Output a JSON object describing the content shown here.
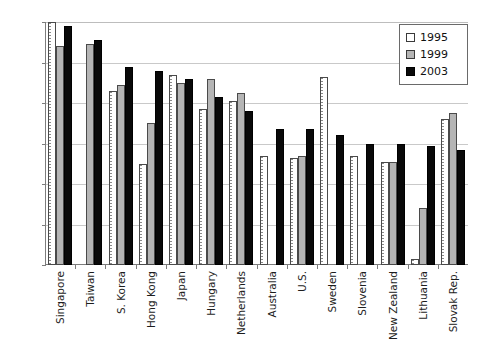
{
  "chart_data": {
    "type": "bar",
    "title": "",
    "subtitle": "",
    "xlabel": "",
    "ylabel": "",
    "ylim": [
      460,
      580
    ],
    "yticks": [
      460,
      480,
      500,
      520,
      540,
      560,
      580
    ],
    "grid": true,
    "legend_position": "top-right",
    "categories": [
      "Singapore",
      "Taiwan",
      "S. Korea",
      "Hong Kong",
      "Japan",
      "Hungary",
      "Netherlands",
      "Australia",
      "U.S.",
      "Sweden",
      "Slovenia",
      "New Zealand",
      "Lithuania",
      "Slovak Rep."
    ],
    "series": [
      {
        "name": "1995",
        "color": "#ffffff",
        "values": [
          580,
          null,
          546,
          510,
          554,
          537,
          541,
          514,
          513,
          553,
          514,
          511,
          463,
          532
        ]
      },
      {
        "name": "1999",
        "color": "#b5b5b5",
        "values": [
          568,
          569,
          549,
          530,
          550,
          552,
          545,
          null,
          514,
          null,
          null,
          511,
          488,
          535
        ]
      },
      {
        "name": "2003",
        "color": "#0a0a0a",
        "values": [
          578,
          571,
          558,
          556,
          552,
          543,
          536,
          527,
          527,
          524,
          520,
          520,
          519,
          517
        ]
      }
    ]
  },
  "legend": {
    "items": [
      {
        "label": "1995",
        "key": "y1995"
      },
      {
        "label": "1999",
        "key": "y1999"
      },
      {
        "label": "2003",
        "key": "y2003"
      }
    ]
  }
}
